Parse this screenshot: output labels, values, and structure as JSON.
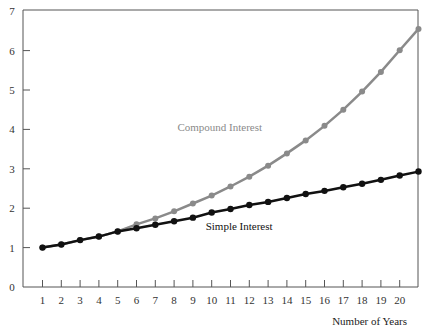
{
  "chart_data": {
    "type": "line",
    "title": "",
    "xlabel": "Number of Years",
    "ylabel": "",
    "x": [
      1,
      2,
      3,
      4,
      5,
      6,
      7,
      8,
      9,
      10,
      11,
      12,
      13,
      14,
      15,
      16,
      17,
      18,
      19,
      20,
      21
    ],
    "x_tick_labels": [
      "1",
      "2",
      "3",
      "4",
      "5",
      "6",
      "7",
      "8",
      "9",
      "10",
      "11",
      "12",
      "13",
      "14",
      "15",
      "16",
      "17",
      "18",
      "19",
      "20"
    ],
    "y_tick_labels": [
      "0",
      "1",
      "2",
      "3",
      "4",
      "5",
      "6",
      "7"
    ],
    "ylim": [
      0,
      7
    ],
    "xlim": [
      0,
      21
    ],
    "grid": false,
    "legend": "none (inline annotations)",
    "series": [
      {
        "name": "Compound Interest",
        "color": "#8a8a8a",
        "values": [
          1.0,
          1.08,
          1.19,
          1.28,
          1.41,
          1.59,
          1.74,
          1.92,
          2.12,
          2.32,
          2.55,
          2.8,
          3.08,
          3.39,
          3.72,
          4.09,
          4.5,
          4.96,
          5.46,
          6.01,
          6.55
        ]
      },
      {
        "name": "Simple Interest",
        "color": "#111111",
        "values": [
          1.0,
          1.08,
          1.19,
          1.28,
          1.41,
          1.49,
          1.58,
          1.67,
          1.76,
          1.89,
          1.98,
          2.08,
          2.16,
          2.26,
          2.36,
          2.44,
          2.53,
          2.62,
          2.72,
          2.83,
          2.93
        ]
      }
    ],
    "annotations": [
      {
        "text": "Compound Interest",
        "x": 10.2,
        "y": 4.05,
        "color": "#8a8a8a"
      },
      {
        "text": "Simple Interest",
        "x": 11.7,
        "y": 1.55,
        "color": "#111111"
      }
    ]
  }
}
